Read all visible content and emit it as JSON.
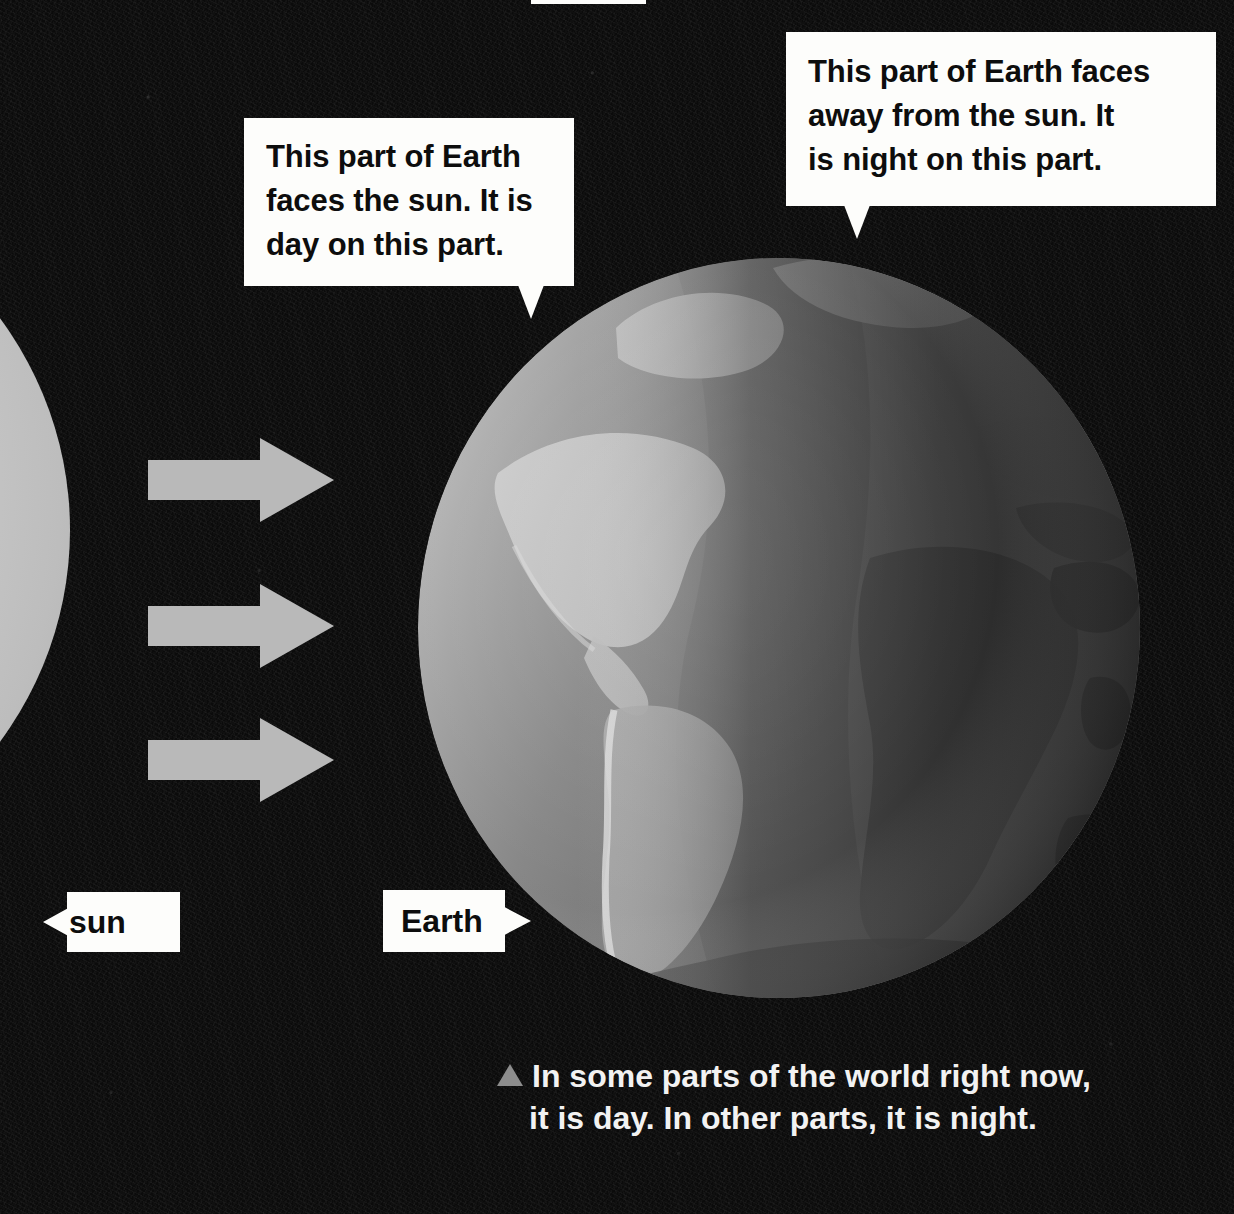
{
  "scene": {
    "title": "Day and night on Earth diagram",
    "background_color": "#0a0a0a",
    "sun": {
      "label": "sun",
      "color": "#cfcfcf",
      "description": "Large light disc at the left edge, mostly cropped off-frame"
    },
    "earth": {
      "label": "Earth",
      "day_side_color": "#cfcfcf",
      "night_side_color": "#4a4a4a",
      "ocean_color": "#6e6e6e",
      "land_color": "#9c9c9c",
      "description": "Globe showing the Atlantic, the Americas on the left, Africa and Europe on the right"
    },
    "rays": {
      "count": 3,
      "color": "#b9b9b9",
      "direction": "right",
      "icon": "arrow-right-icon"
    }
  },
  "callouts": [
    {
      "id": "day",
      "name": "callout-day",
      "text": "This part of Earth faces the sun. It is day on this part.",
      "lines": [
        "This part of Earth",
        "faces the sun. It is",
        "day on this part."
      ],
      "tail": "down"
    },
    {
      "id": "night",
      "name": "callout-night",
      "text": "This part of Earth faces away from the sun. It is night on this part.",
      "lines": [
        "This part of Earth faces",
        "away from the sun. It",
        "is night on this part."
      ],
      "tail": "down"
    }
  ],
  "labels": {
    "sun_tag": "sun",
    "earth_tag": "Earth"
  },
  "caption": {
    "bullet": "triangle-up-icon",
    "text": "In some parts of the world right now, it is day. In other parts, it is night.",
    "line1": "In some parts of the world right now,",
    "line2": "it is day. In other parts, it is night."
  }
}
